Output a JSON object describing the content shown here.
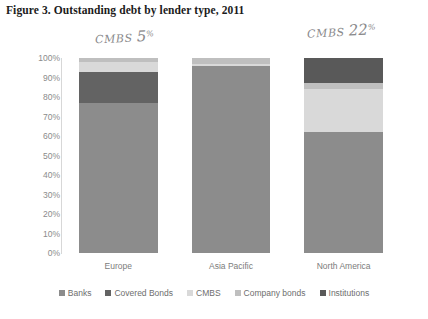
{
  "figure": {
    "caption": "Figure 3. Outstanding debt by lender type, 2011"
  },
  "annotations": [
    {
      "id": "europe-cmbs",
      "prefix": "CMBS",
      "value": "5",
      "suffix": "%",
      "note": "handwritten note above Europe bar"
    },
    {
      "id": "northamerica-cmbs",
      "prefix": "CMBS",
      "value": "22",
      "suffix": "%",
      "note": "handwritten note above North America bar"
    }
  ],
  "chart_data": {
    "type": "bar",
    "subtype": "stacked-100-percent",
    "title": "Figure 3. Outstanding debt by lender type, 2011",
    "xlabel": "",
    "ylabel": "",
    "ylim": [
      0,
      100
    ],
    "ytick_labels": [
      "100%",
      "90%",
      "80%",
      "70%",
      "60%",
      "50%",
      "40%",
      "30%",
      "20%",
      "10%",
      "0%"
    ],
    "ytick_values": [
      100,
      90,
      80,
      70,
      60,
      50,
      40,
      30,
      20,
      10,
      0
    ],
    "grid": false,
    "legend_position": "bottom",
    "categories": [
      "Europe",
      "Asia Pacific",
      "North America"
    ],
    "series": [
      {
        "name": "Banks",
        "color": "#8c8c8c",
        "values": [
          77,
          96,
          62
        ]
      },
      {
        "name": "Covered Bonds",
        "color": "#636363",
        "values": [
          16,
          0,
          0
        ]
      },
      {
        "name": "CMBS",
        "color": "#d9d9d9",
        "values": [
          5,
          1,
          22
        ]
      },
      {
        "name": "Company bonds",
        "color": "#bfbfbf",
        "values": [
          2,
          3,
          3
        ]
      },
      {
        "name": "Institutions",
        "color": "#595959",
        "values": [
          0,
          0,
          13
        ]
      }
    ]
  }
}
